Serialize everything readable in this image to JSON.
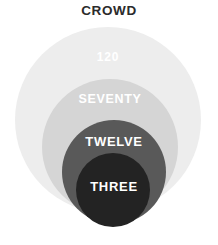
{
  "title": "CROWD",
  "chart_data": {
    "type": "pie",
    "title": "CROWD",
    "subtitle": "",
    "xlabel": "",
    "ylabel": "",
    "legend_position": "none",
    "grid": false,
    "layout": "concentric-nested-circles",
    "categories": [
      "120",
      "SEVENTY",
      "TWELVE",
      "THREE"
    ],
    "values": [
      120,
      70,
      12,
      3
    ],
    "labels": [
      "120",
      "SEVENTY",
      "TWELVE",
      "THREE"
    ],
    "series": [
      {
        "name": "Crowd size tiers",
        "values": [
          120,
          70,
          12,
          3
        ]
      }
    ],
    "rings": [
      {
        "label": "120",
        "value": 120,
        "color": "#ededed",
        "text_color": "#ffffff",
        "cx": 108,
        "cy": 120,
        "r": 93
      },
      {
        "label": "SEVENTY",
        "value": 70,
        "color": "#d5d5d5",
        "text_color": "#ffffff",
        "cx": 110,
        "cy": 147,
        "r": 68
      },
      {
        "label": "TWELVE",
        "value": 12,
        "color": "#595959",
        "text_color": "#ffffff",
        "cx": 114,
        "cy": 172,
        "r": 52
      },
      {
        "label": "THREE",
        "value": 3,
        "color": "#232323",
        "text_color": "#ffffff",
        "cx": 113,
        "cy": 190,
        "r": 37
      }
    ],
    "background": "#ffffff",
    "title_color": "#2b2b2b"
  },
  "labels": {
    "outer": "120",
    "second": "SEVENTY",
    "third": "TWELVE",
    "inner": "THREE"
  }
}
